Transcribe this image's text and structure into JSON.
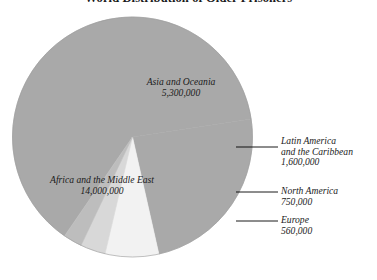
{
  "chart": {
    "title": "World Distribution of Older Prisoners"
  },
  "chart_data": {
    "type": "pie",
    "title": "World Distribution of Older Prisoners",
    "xlabel": "",
    "ylabel": "",
    "legend_position": "none",
    "grid": false,
    "total": 22210000,
    "categories": [
      "Africa and the Middle East",
      "Asia and Oceania",
      "Latin America and the Caribbean",
      "North America",
      "Europe"
    ],
    "values": [
      14000000,
      5300000,
      1600000,
      750000,
      560000
    ],
    "value_labels": [
      "14,000,000",
      "5,300,000",
      "1,600,000",
      "750,000",
      "560,000"
    ],
    "colors": [
      "#a9a9a9",
      "#a9a9a9",
      "#f2f2f2",
      "#d8d8d8",
      "#bdbdbd"
    ],
    "slices": [
      {
        "name": "Africa and the Middle East",
        "value": 14000000,
        "value_label": "14,000,000",
        "percent": 63.0,
        "color": "#a9a9a9",
        "label_placement": "inside"
      },
      {
        "name": "Asia and Oceania",
        "value": 5300000,
        "value_label": "5,300,000",
        "percent": 23.9,
        "color": "#a9a9a9",
        "label_placement": "inside"
      },
      {
        "name": "Latin America and the Caribbean",
        "value": 1600000,
        "value_label": "1,600,000",
        "percent": 7.2,
        "color": "#f2f2f2",
        "label_placement": "callout"
      },
      {
        "name": "North America",
        "value": 750000,
        "value_label": "750,000",
        "percent": 3.4,
        "color": "#d8d8d8",
        "label_placement": "callout"
      },
      {
        "name": "Europe",
        "value": 560000,
        "value_label": "560,000",
        "percent": 2.5,
        "color": "#bdbdbd",
        "label_placement": "callout"
      }
    ]
  },
  "labels": {
    "asia": {
      "line1": "Asia and Oceania",
      "value": "5,300,000"
    },
    "africa": {
      "line1": "Africa and the Middle East",
      "value": "14,000,000"
    },
    "latin": {
      "line1": "Latin America",
      "line2": "and the Caribbean",
      "value": "1,600,000"
    },
    "north": {
      "line1": "North America",
      "value": "750,000"
    },
    "europe": {
      "line1": "Europe",
      "value": "560,000"
    }
  },
  "colors": {
    "background": "#ffffff",
    "pie_main": "#a9a9a9",
    "pie_latin": "#f2f2f2",
    "pie_north": "#d8d8d8",
    "pie_europe": "#bdbdbd",
    "text": "#1b1b1b",
    "leader_line": "#000000"
  }
}
